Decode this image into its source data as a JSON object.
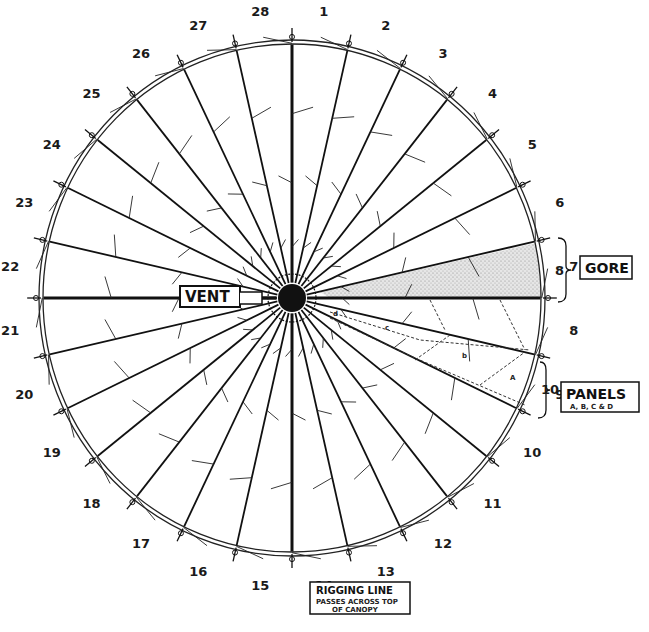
{
  "diagram": {
    "gore_count": 28,
    "gore_numbers": [
      "1",
      "2",
      "3",
      "4",
      "5",
      "6",
      "7",
      "8",
      "9",
      "10",
      "11",
      "12",
      "13",
      "14",
      "15",
      "16",
      "17",
      "18",
      "19",
      "20",
      "21",
      "22",
      "23",
      "24",
      "25",
      "26",
      "27",
      "28"
    ],
    "labels": {
      "vent": "VENT",
      "gore": "GORE",
      "gore_number": "8",
      "panels": "PANELS",
      "panels_sub": "A, B, C & D",
      "panels_gore_number": "10",
      "rigging_line_title": "RIGGING LINE",
      "rigging_line_line2": "PASSES ACROSS TOP",
      "rigging_line_line3": "OF CANOPY"
    },
    "panel_letters": [
      "A",
      "B",
      "C",
      "D"
    ],
    "colors": {
      "ink": "#111111",
      "shading": "#c8c8c8",
      "paper": "#ffffff"
    }
  }
}
